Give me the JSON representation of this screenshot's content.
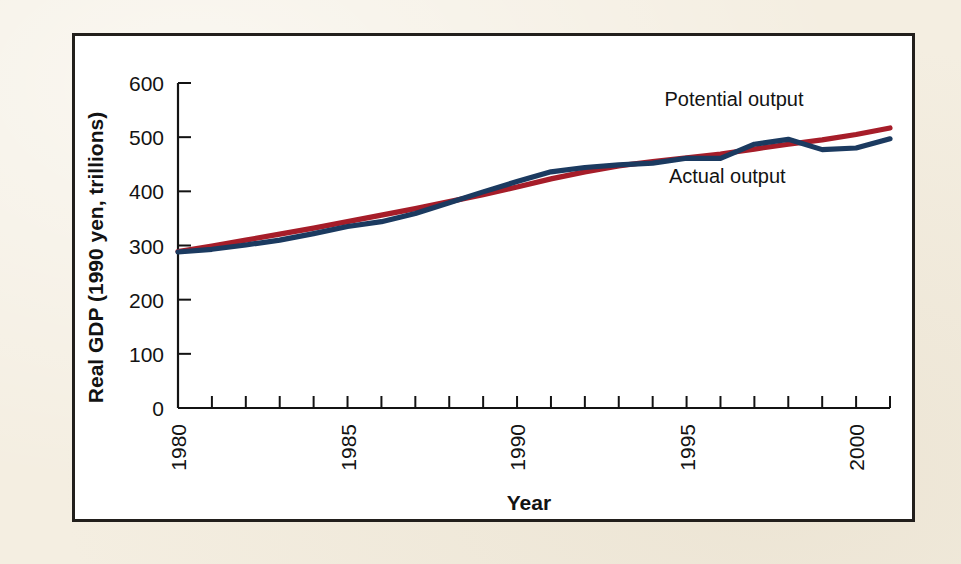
{
  "figure": {
    "background_color": "#f4eee1",
    "panel_color": "#ffffff",
    "border_color": "#221f1c"
  },
  "chart_data": {
    "type": "line",
    "title": "",
    "xlabel": "Year",
    "ylabel": "Real GDP (1990 yen, trillions)",
    "xlim": [
      1980,
      2001
    ],
    "ylim": [
      0,
      600
    ],
    "xticks": [
      1980,
      1985,
      1990,
      1995,
      2000
    ],
    "xtick_labels": [
      "1980",
      "1985",
      "1990",
      "1995",
      "2000"
    ],
    "xtick_rotation": 90,
    "minor_xticks_every": 1,
    "yticks": [
      0,
      100,
      200,
      300,
      400,
      500,
      600
    ],
    "ytick_labels": [
      "0",
      "100",
      "200",
      "300",
      "400",
      "500",
      "600"
    ],
    "grid": false,
    "legend_position": "inline-annotations",
    "x": [
      1980,
      1981,
      1982,
      1983,
      1984,
      1985,
      1986,
      1987,
      1988,
      1989,
      1990,
      1991,
      1992,
      1993,
      1994,
      1995,
      1996,
      1997,
      1998,
      1999,
      2000,
      2001
    ],
    "series": [
      {
        "name": "Potential output",
        "color": "#a61d29",
        "label_anchor_x": 1996.4,
        "label_anchor_y": 558,
        "values": [
          289,
          299,
          310,
          321,
          332,
          344,
          356,
          368,
          381,
          394,
          408,
          423,
          436,
          447,
          455,
          462,
          469,
          478,
          487,
          495,
          505,
          517
        ]
      },
      {
        "name": "Actual output",
        "color": "#1b3a60",
        "label_anchor_x": 1996.2,
        "label_anchor_y": 416,
        "values": [
          288,
          293,
          301,
          310,
          322,
          335,
          344,
          359,
          379,
          399,
          418,
          436,
          444,
          449,
          452,
          461,
          461,
          487,
          496,
          477,
          480,
          497
        ]
      }
    ],
    "annotations": [
      {
        "text": "Potential output",
        "series": "Potential output"
      },
      {
        "text": "Actual output",
        "series": "Actual output"
      }
    ]
  }
}
